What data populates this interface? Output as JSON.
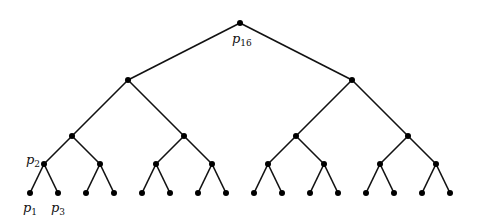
{
  "diagram": {
    "type": "binary-tree",
    "depth": 4,
    "colors": {
      "edge": "#111111",
      "node": "#000000",
      "background": "#ffffff"
    },
    "levels_y": [
      23,
      80,
      136,
      164,
      193
    ],
    "nodes": [
      {
        "id": "root",
        "x": 240,
        "y": 23,
        "level": 0
      },
      {
        "id": "L",
        "x": 128,
        "y": 80,
        "level": 1,
        "parent": "root"
      },
      {
        "id": "R",
        "x": 352,
        "y": 80,
        "level": 1,
        "parent": "root"
      },
      {
        "id": "LL",
        "x": 72,
        "y": 136,
        "level": 2,
        "parent": "L"
      },
      {
        "id": "LR",
        "x": 184,
        "y": 136,
        "level": 2,
        "parent": "L"
      },
      {
        "id": "RL",
        "x": 296,
        "y": 136,
        "level": 2,
        "parent": "R"
      },
      {
        "id": "RR",
        "x": 408,
        "y": 136,
        "level": 2,
        "parent": "R"
      },
      {
        "id": "LLL",
        "x": 44,
        "y": 164,
        "level": 3,
        "parent": "LL"
      },
      {
        "id": "LLR",
        "x": 100,
        "y": 164,
        "level": 3,
        "parent": "LL"
      },
      {
        "id": "LRL",
        "x": 156,
        "y": 164,
        "level": 3,
        "parent": "LR"
      },
      {
        "id": "LRR",
        "x": 212,
        "y": 164,
        "level": 3,
        "parent": "LR"
      },
      {
        "id": "RLL",
        "x": 268,
        "y": 164,
        "level": 3,
        "parent": "RL"
      },
      {
        "id": "RLR",
        "x": 324,
        "y": 164,
        "level": 3,
        "parent": "RL"
      },
      {
        "id": "RRL",
        "x": 380,
        "y": 164,
        "level": 3,
        "parent": "RR"
      },
      {
        "id": "RRR",
        "x": 436,
        "y": 164,
        "level": 3,
        "parent": "RR"
      },
      {
        "id": "leaf1",
        "x": 30,
        "y": 193,
        "level": 4,
        "parent": "LLL"
      },
      {
        "id": "leaf2",
        "x": 58,
        "y": 193,
        "level": 4,
        "parent": "LLL"
      },
      {
        "id": "leaf3",
        "x": 86,
        "y": 193,
        "level": 4,
        "parent": "LLR"
      },
      {
        "id": "leaf4",
        "x": 114,
        "y": 193,
        "level": 4,
        "parent": "LLR"
      },
      {
        "id": "leaf5",
        "x": 142,
        "y": 193,
        "level": 4,
        "parent": "LRL"
      },
      {
        "id": "leaf6",
        "x": 170,
        "y": 193,
        "level": 4,
        "parent": "LRL"
      },
      {
        "id": "leaf7",
        "x": 198,
        "y": 193,
        "level": 4,
        "parent": "LRR"
      },
      {
        "id": "leaf8",
        "x": 226,
        "y": 193,
        "level": 4,
        "parent": "LRR"
      },
      {
        "id": "leaf9",
        "x": 254,
        "y": 193,
        "level": 4,
        "parent": "RLL"
      },
      {
        "id": "leaf10",
        "x": 282,
        "y": 193,
        "level": 4,
        "parent": "RLL"
      },
      {
        "id": "leaf11",
        "x": 310,
        "y": 193,
        "level": 4,
        "parent": "RLR"
      },
      {
        "id": "leaf12",
        "x": 338,
        "y": 193,
        "level": 4,
        "parent": "RLR"
      },
      {
        "id": "leaf13",
        "x": 366,
        "y": 193,
        "level": 4,
        "parent": "RRL"
      },
      {
        "id": "leaf14",
        "x": 394,
        "y": 193,
        "level": 4,
        "parent": "RRL"
      },
      {
        "id": "leaf15",
        "x": 422,
        "y": 193,
        "level": 4,
        "parent": "RRR"
      },
      {
        "id": "leaf16",
        "x": 450,
        "y": 193,
        "level": 4,
        "parent": "RRR"
      }
    ],
    "labels": [
      {
        "node": "root",
        "base": "p",
        "sub": "16",
        "x": 232,
        "y": 43
      },
      {
        "node": "LLL",
        "base": "p",
        "sub": "2",
        "x": 26,
        "y": 164
      },
      {
        "node": "leaf1",
        "base": "p",
        "sub": "1",
        "x": 23,
        "y": 212
      },
      {
        "node": "leaf2",
        "base": "p",
        "sub": "3",
        "x": 51,
        "y": 212
      }
    ]
  }
}
